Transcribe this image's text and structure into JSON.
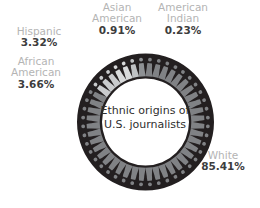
{
  "chart_data": {
    "type": "pie",
    "title": "Ethnic origins of U.S. journalists",
    "title_line1": "Ethnic origins of",
    "title_line2": "U.S. journalists",
    "subtitle": "",
    "xlabel": "",
    "ylabel": "",
    "donut": true,
    "legend_position": "around-chart",
    "grid": false,
    "icon_style": "person-pictogram",
    "total_icons": 44,
    "categories": [
      "White",
      "African American",
      "Hispanic",
      "Asian American",
      "American Indian"
    ],
    "values": [
      85.41,
      3.66,
      3.32,
      0.91,
      0.23
    ],
    "unit": "%",
    "colors": [
      "#808285",
      "#c9cbcd",
      "#d8dadb",
      "#bfc2c4",
      "#8e9194"
    ],
    "ring_background": "#231f20",
    "slices": [
      {
        "name": "White",
        "value": 85.41,
        "label": "85.41%",
        "color": "#808285",
        "icon_count": 37
      },
      {
        "name": "African American",
        "value": 3.66,
        "label": "3.66%",
        "color": "#c9cbcd",
        "icon_count": 3
      },
      {
        "name": "Hispanic",
        "value": 3.32,
        "label": "3.32%",
        "color": "#d8dadb",
        "icon_count": 2
      },
      {
        "name": "Asian American",
        "value": 0.91,
        "label": "0.91%",
        "color": "#bfc2c4",
        "icon_count": 1
      },
      {
        "name": "American Indian",
        "value": 0.23,
        "label": "0.23%",
        "color": "#8e9194",
        "icon_count": 1
      }
    ]
  },
  "labels": {
    "asian": {
      "line1": "Asian",
      "line2": "American",
      "pct": "0.91%"
    },
    "american_indian": {
      "line1": "American",
      "line2": "Indian",
      "pct": "0.23%"
    },
    "hispanic": {
      "line1": "Hispanic",
      "pct": "3.32%"
    },
    "african_american": {
      "line1": "African",
      "line2": "American",
      "pct": "3.66%"
    },
    "white": {
      "line1": "White",
      "pct": "85.41%"
    }
  },
  "center": {
    "line1": "Ethnic origins of",
    "line2": "U.S. journalists"
  },
  "colors": {
    "category_text": "#b4b4b4",
    "value_text": "#3d3d3d",
    "center_text": "#2f2f2f",
    "ring_dark": "#231f20",
    "background": "#ffffff"
  }
}
